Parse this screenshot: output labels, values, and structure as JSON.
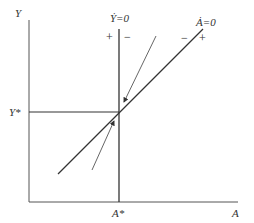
{
  "diagram": {
    "type": "phase-diagram",
    "axes": {
      "y_label": "Y",
      "x_label": "A",
      "y_star_label": "Y*",
      "a_star_label": "A*"
    },
    "curves": {
      "ydot_zero": {
        "label": "Ẏ=0",
        "left_sign": "+",
        "right_sign": "−"
      },
      "adot_zero": {
        "label": "Ȧ=0",
        "left_sign": "−",
        "right_sign": "+"
      }
    },
    "arrows": [
      {
        "name": "upper-arrow",
        "direction": "toward equilibrium from above"
      },
      {
        "name": "lower-arrow",
        "direction": "toward equilibrium from below"
      }
    ],
    "colors": {
      "line": "#333333",
      "thin_line": "#555555",
      "background": "#ffffff"
    }
  }
}
